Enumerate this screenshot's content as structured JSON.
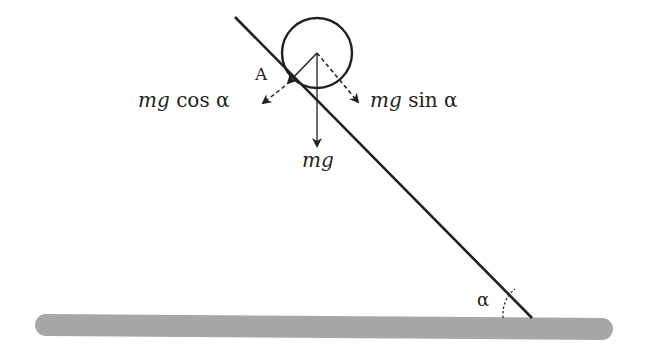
{
  "diagram": {
    "type": "physics-free-body",
    "labels": {
      "contact_point": "A",
      "cos_component": {
        "italic": "mg",
        "rest": " cos α"
      },
      "sin_component": {
        "italic": "mg",
        "rest": " sin α"
      },
      "weight": "mg",
      "angle": "α"
    },
    "colors": {
      "ink": "#231f20",
      "ground": "#a7a7a7"
    },
    "geometry": {
      "incline": {
        "x1": 235,
        "y1": 17,
        "x2": 532,
        "y2": 318
      },
      "circle": {
        "cx": 317,
        "cy": 53,
        "r": 35
      },
      "contact_point": {
        "x": 287,
        "y": 82
      },
      "ground": {
        "x1": 35,
        "y1": 326,
        "x2": 612,
        "y2": 330,
        "thickness": 22
      }
    }
  }
}
